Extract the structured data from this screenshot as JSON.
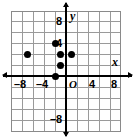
{
  "figure": {
    "kind": "coordinate-plane-scatter",
    "x_axis_name": "x",
    "y_axis_name": "y",
    "origin_label": "O"
  },
  "chart_data": {
    "type": "scatter",
    "title": "",
    "xlabel": "x",
    "ylabel": "y",
    "xlim": [
      -10,
      10
    ],
    "ylim": [
      -11,
      11
    ],
    "grid": true,
    "grid_step": 2,
    "legend": "none",
    "origin_label": "O",
    "x_ticks": [
      -8,
      -4,
      4,
      8
    ],
    "x_tick_labels": [
      "–8",
      "–4",
      "4",
      "8"
    ],
    "y_ticks": [
      8,
      4,
      -8
    ],
    "y_tick_labels": [
      "8",
      "4",
      "–8"
    ],
    "points": [
      {
        "x": -7,
        "y": 4
      },
      {
        "x": -2,
        "y": 6
      },
      {
        "x": -1,
        "y": 4
      },
      {
        "x": 1,
        "y": 4
      },
      {
        "x": -1,
        "y": 2
      },
      {
        "x": -2,
        "y": 0
      }
    ]
  },
  "labels": {
    "x_neg8": "–8",
    "x_neg4": "–4",
    "origin": "O",
    "x_pos4": "4",
    "x_pos8": "8",
    "y_pos8": "8",
    "y_pos4": "4",
    "y_neg8": "–8",
    "axis_x": "x",
    "axis_y": "y"
  }
}
